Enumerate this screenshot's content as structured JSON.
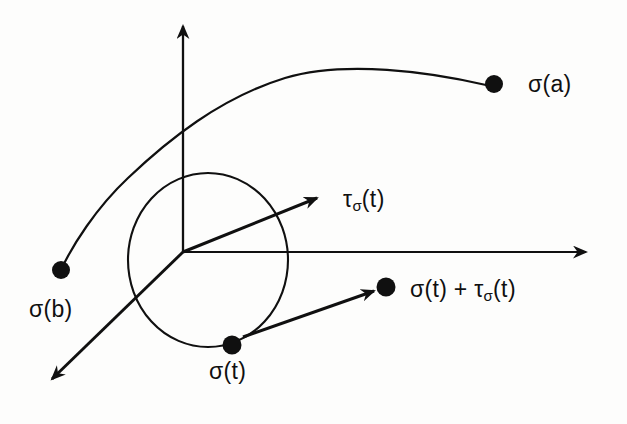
{
  "figure": {
    "kind": "tangent-vector-diagram",
    "background_color": "#fdfdfc",
    "ink_color": "#101010",
    "labels": {
      "sigma_a": "σ(a)",
      "sigma_b": "σ(b)",
      "sigma_t": "σ(t)",
      "tau_sigma_t_base": "τ",
      "tau_sigma_t_sub": "σ",
      "tau_sigma_t_arg": "(t)",
      "sum_first": "σ(t) + τ",
      "sum_sub": "σ",
      "sum_arg": "(t)"
    },
    "icon_names": {
      "vertical_axis": "axis-arrow-up-icon",
      "horizontal_axis": "axis-arrow-right-icon",
      "diagonal_axis": "axis-arrow-down-left-icon",
      "tangent_vector": "tangent-vector-arrow-icon",
      "translated_vector": "translated-vector-arrow-icon",
      "curve": "curve-path-icon",
      "circle": "circle-outline-icon"
    },
    "geometry": {
      "origin": [
        183,
        252
      ],
      "axes": [
        {
          "name": "vertical-axis",
          "from": [
            183,
            252
          ],
          "to": [
            183,
            14
          ]
        },
        {
          "name": "horizontal-axis",
          "from": [
            183,
            252
          ],
          "to": [
            598,
            252
          ]
        },
        {
          "name": "diagonal-axis",
          "from": [
            183,
            252
          ],
          "to": [
            42,
            388
          ]
        }
      ],
      "circle": {
        "cx": 208,
        "cy": 260,
        "rx": 80,
        "ry": 87,
        "rotation": 0
      },
      "points": [
        {
          "name": "sigma-a-point",
          "x": 494,
          "y": 84,
          "r": 9
        },
        {
          "name": "sigma-b-point",
          "x": 61,
          "y": 270,
          "r": 9
        },
        {
          "name": "sigma-t-point",
          "x": 232,
          "y": 345,
          "r": 9.5
        },
        {
          "name": "sum-point",
          "x": 386,
          "y": 287,
          "r": 9.5
        }
      ],
      "vectors": [
        {
          "name": "tangent-vector",
          "from": [
            183,
            252
          ],
          "to": [
            330,
            193
          ]
        },
        {
          "name": "translated-vector",
          "from": [
            243,
            337
          ],
          "to": [
            386,
            287
          ]
        }
      ],
      "curve": "M 61 270 C 72 246 96 208 128 178 C 168 140 220 98 285 78 C 345 60 430 72 486 85"
    }
  }
}
